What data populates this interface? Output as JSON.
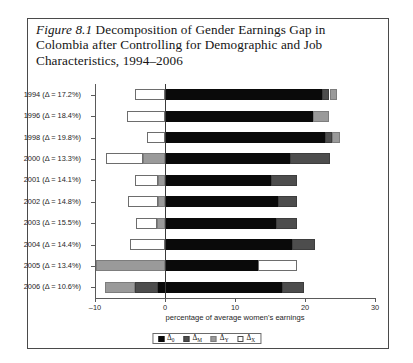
{
  "figure": {
    "number_label": "Figure 8.1",
    "caption": " Decomposition of Gender Earnings Gap in Colombia after Controlling for Demographic and Job Characteristics, 1994–2006"
  },
  "chart_data": {
    "type": "bar",
    "orientation": "horizontal",
    "stacked": true,
    "title": "Decomposition of Gender Earnings Gap in Colombia after Controlling for Demographic and Job Characteristics, 1994–2006",
    "xlabel": "percentage of average women's earnings",
    "ylabel": "",
    "xlim": [
      -10,
      30
    ],
    "xticks": [
      -10,
      0,
      10,
      20,
      30
    ],
    "xticklabels": [
      "–10",
      "0",
      "10",
      "20",
      "30"
    ],
    "grid": false,
    "legend_position": "bottom",
    "categories": [
      "1994 (Δ = 17.2%)",
      "1996 (Δ = 18.4%)",
      "1998 (Δ = 19.8%)",
      "2000 (Δ = 13.3%)",
      "2001 (Δ = 14.1%)",
      "2002 (Δ = 14.8%)",
      "2003 (Δ = 15.5%)",
      "2004 (Δ = 14.4%)",
      "2005 (Δ = 13.4%)",
      "2006 (Δ = 10.6%)"
    ],
    "years": [
      1994,
      1996,
      1998,
      2000,
      2001,
      2002,
      2003,
      2004,
      2005,
      2006
    ],
    "gap_values": [
      17.2,
      18.4,
      19.8,
      13.3,
      14.1,
      14.8,
      15.5,
      14.4,
      13.4,
      10.6
    ],
    "series": [
      {
        "name": "Δ0",
        "key": "s0",
        "color": "#0a0a0a",
        "values": [
          22.4,
          21.1,
          22.8,
          17.9,
          15.2,
          16.2,
          15.9,
          18.1,
          13.3,
          16.7
        ]
      },
      {
        "name": "ΔM",
        "key": "sM",
        "color": "#4d4d4d",
        "values": [
          1.1,
          0.0,
          1.1,
          5.7,
          3.6,
          2.7,
          3.0,
          0.0,
          4.0,
          0.0
        ]
      },
      {
        "name": "ΔY",
        "key": "sY",
        "color": "#9a9a9a",
        "values": [
          1.1,
          2.4,
          1.1,
          3.1,
          1.0,
          1.0,
          1.1,
          4.9,
          4.3,
          1.0
        ]
      },
      {
        "name": "ΔX",
        "key": "sX",
        "color": "#ffffff",
        "values": [
          4.3,
          5.4,
          2.6,
          8.4,
          3.3,
          4.3,
          3.1,
          4.0,
          5.6,
          4.3
        ]
      }
    ],
    "bars": [
      {
        "category": "1994 (Δ = 17.2%)",
        "segments": [
          {
            "key": "sX",
            "start": -4.3,
            "end": 0.0
          },
          {
            "key": "s0",
            "start": 0.0,
            "end": 22.4
          },
          {
            "key": "sM",
            "start": 22.4,
            "end": 23.5
          },
          {
            "key": "sY",
            "start": 23.5,
            "end": 24.6
          }
        ]
      },
      {
        "category": "1996 (Δ = 18.4%)",
        "segments": [
          {
            "key": "sX",
            "start": -5.4,
            "end": 0.0
          },
          {
            "key": "s0",
            "start": 0.0,
            "end": 21.1
          },
          {
            "key": "sY",
            "start": 21.1,
            "end": 23.5
          }
        ]
      },
      {
        "category": "1998 (Δ = 19.8%)",
        "segments": [
          {
            "key": "sX",
            "start": -2.6,
            "end": 0.0
          },
          {
            "key": "s0",
            "start": 0.0,
            "end": 22.8
          },
          {
            "key": "sM",
            "start": 22.8,
            "end": 23.9
          },
          {
            "key": "sY",
            "start": 23.9,
            "end": 25.0
          }
        ]
      },
      {
        "category": "2000 (Δ = 13.3%)",
        "segments": [
          {
            "key": "sX",
            "start": -8.4,
            "end": -3.1
          },
          {
            "key": "sY",
            "start": -3.1,
            "end": 0.0
          },
          {
            "key": "s0",
            "start": 0.0,
            "end": 17.9
          },
          {
            "key": "sM",
            "start": 17.9,
            "end": 23.6
          }
        ]
      },
      {
        "category": "2001 (Δ = 14.1%)",
        "segments": [
          {
            "key": "sX",
            "start": -4.3,
            "end": -1.0
          },
          {
            "key": "sY",
            "start": -1.0,
            "end": 0.0
          },
          {
            "key": "s0",
            "start": 0.0,
            "end": 15.2
          },
          {
            "key": "sM",
            "start": 15.2,
            "end": 18.8
          }
        ]
      },
      {
        "category": "2002 (Δ = 14.8%)",
        "segments": [
          {
            "key": "sX",
            "start": -5.3,
            "end": -1.0
          },
          {
            "key": "sY",
            "start": -1.0,
            "end": 0.0
          },
          {
            "key": "s0",
            "start": 0.0,
            "end": 16.2
          },
          {
            "key": "sM",
            "start": 16.2,
            "end": 18.9
          }
        ]
      },
      {
        "category": "2003 (Δ = 15.5%)",
        "segments": [
          {
            "key": "sX",
            "start": -4.1,
            "end": -1.1
          },
          {
            "key": "sY",
            "start": -1.1,
            "end": 0.0
          },
          {
            "key": "s0",
            "start": 0.0,
            "end": 15.9
          },
          {
            "key": "sM",
            "start": 15.9,
            "end": 18.9
          }
        ]
      },
      {
        "category": "2004 (Δ = 14.4%)",
        "segments": [
          {
            "key": "sX",
            "start": -5.0,
            "end": 0.0
          },
          {
            "key": "s0",
            "start": 0.0,
            "end": 18.1
          },
          {
            "key": "sM",
            "start": 18.1,
            "end": 21.4
          }
        ]
      },
      {
        "category": "2005 (Δ = 13.4%)",
        "segments": [
          {
            "key": "sY",
            "start": -9.9,
            "end": 0.0
          },
          {
            "key": "s0",
            "start": 0.0,
            "end": 13.3
          },
          {
            "key": "sX",
            "start": 13.3,
            "end": 18.9
          }
        ]
      },
      {
        "category": "2006 (Δ = 10.6%)",
        "segments": [
          {
            "key": "sY",
            "start": -8.6,
            "end": -4.3
          },
          {
            "key": "sM",
            "start": -4.3,
            "end": -1.0
          },
          {
            "key": "s0",
            "start": -1.0,
            "end": 0.0
          },
          {
            "key": "s0",
            "start": 0.0,
            "end": 16.7
          },
          {
            "key": "sM",
            "start": 16.7,
            "end": 19.9
          }
        ]
      }
    ],
    "legend": [
      {
        "label": "Δ",
        "sub": "0",
        "key": "s0"
      },
      {
        "label": "Δ",
        "sub": "M",
        "key": "sM"
      },
      {
        "label": "Δ",
        "sub": "Y",
        "key": "sY"
      },
      {
        "label": "Δ",
        "sub": "X",
        "key": "sX"
      }
    ]
  }
}
